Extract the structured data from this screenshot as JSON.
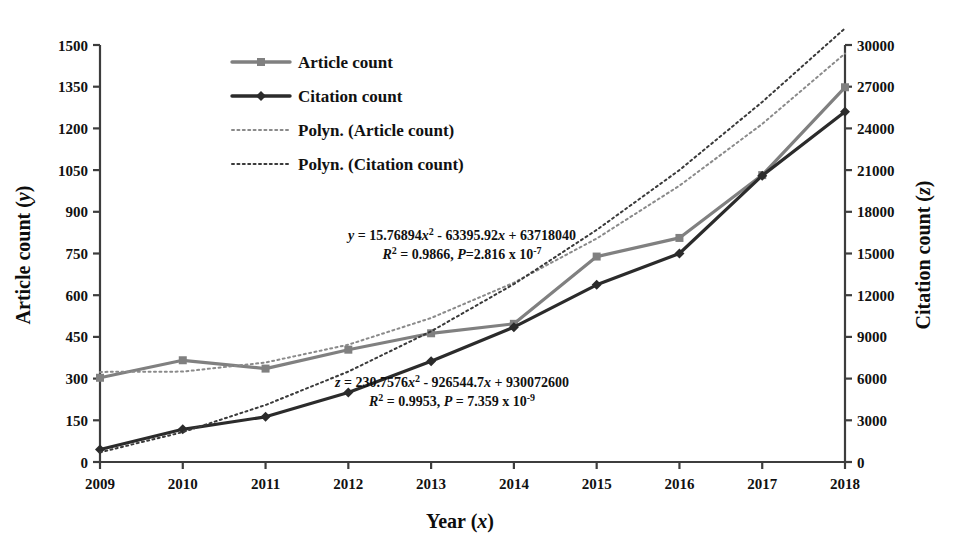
{
  "chart_data": {
    "type": "line",
    "title": "",
    "xlabel": "Year (x)",
    "ylabel": "Article count (y)",
    "y2label": "Citation count (z)",
    "categories": [
      2009,
      2010,
      2011,
      2012,
      2013,
      2014,
      2015,
      2016,
      2017,
      2018
    ],
    "x_tick_labels": [
      "2009",
      "2010",
      "2011",
      "2012",
      "2013",
      "2014",
      "2015",
      "2016",
      "2017",
      "2018"
    ],
    "xlim": [
      2009,
      2018
    ],
    "ylim": [
      0,
      1500
    ],
    "y_tick_labels": [
      "0",
      "150",
      "300",
      "450",
      "600",
      "750",
      "900",
      "1050",
      "1200",
      "1350",
      "1500"
    ],
    "y_ticks": [
      0,
      150,
      300,
      450,
      600,
      750,
      900,
      1050,
      1200,
      1350,
      1500
    ],
    "y2lim": [
      0,
      30000
    ],
    "y2_tick_labels": [
      "0",
      "3000",
      "6000",
      "9000",
      "12000",
      "15000",
      "18000",
      "21000",
      "24000",
      "27000",
      "30000"
    ],
    "y2_ticks": [
      0,
      3000,
      6000,
      9000,
      12000,
      15000,
      18000,
      21000,
      24000,
      27000,
      30000
    ],
    "grid": false,
    "legend_position": "top-left",
    "series": [
      {
        "name": "Article count",
        "axis": "left",
        "style": "solid",
        "color": "#808080",
        "marker": "square",
        "values": [
          303,
          366,
          336,
          404,
          463,
          497,
          739,
          806,
          1032,
          1348
        ]
      },
      {
        "name": "Citation count",
        "axis": "right",
        "style": "solid",
        "color": "#2b2b2b",
        "marker": "diamond",
        "values": [
          900,
          2350,
          3250,
          5000,
          7250,
          9700,
          12750,
          15000,
          20600,
          25200
        ]
      },
      {
        "name": "Polyn. (Article count)",
        "axis": "left",
        "style": "dotted",
        "color": "#8a8a8a",
        "marker": "none",
        "values": [
          324,
          325,
          358,
          422,
          518,
          645,
          804,
          994,
          1216,
          1469
        ]
      },
      {
        "name": "Polyn. (Citation count)",
        "axis": "right",
        "style": "dotted",
        "color": "#3a3a3a",
        "marker": "none",
        "values": [
          700,
          2150,
          4100,
          6500,
          9400,
          12800,
          16700,
          21000,
          25900,
          31200
        ]
      }
    ],
    "annotations": [
      {
        "id": "article-equation",
        "line1": "y = 15.76894x² - 63395.92x + 63718040",
        "line2": "R² = 0.9866, P=2.816 x 10⁻⁷"
      },
      {
        "id": "citation-equation",
        "line1": "z = 230.7576x² - 926544.7x + 930072600",
        "line2": "R² = 0.9953, P = 7.359 x 10⁻⁹"
      }
    ]
  },
  "legend": {
    "items": [
      {
        "label": "Article count"
      },
      {
        "label": "Citation count"
      },
      {
        "label": "Polyn. (Article count)"
      },
      {
        "label": "Polyn. (Citation count)"
      }
    ]
  },
  "equations": {
    "article": {
      "lead": "y",
      "body": " = 15.76894",
      "var1": "x",
      "sup1": "2",
      "body2": " - 63395.92",
      "var2": "x",
      "body3": " + 63718040",
      "r_lead": "R",
      "r_sup": "2",
      "r_body": " = 0.9866, ",
      "p_lead": "P",
      "p_body": "=2.816 x 10",
      "p_sup": "-7"
    },
    "citation": {
      "lead": "z",
      "body": " = 230.7576",
      "var1": "x",
      "sup1": "2",
      "body2": " - 926544.7",
      "var2": "x",
      "body3": " + 930072600",
      "r_lead": "R",
      "r_sup": "2",
      "r_body": " = 0.9953, ",
      "p_lead": "P",
      "p_body": " = 7.359 x 10",
      "p_sup": "-9"
    }
  },
  "axes": {
    "left_title_main": "Article count (",
    "left_title_var": "y",
    "left_title_end": ")",
    "right_title_main": "Citation count (",
    "right_title_var": "z",
    "right_title_end": ")",
    "x_title_main": "Year (",
    "x_title_var": "x",
    "x_title_end": ")"
  },
  "colors": {
    "article": "#808080",
    "citation": "#2b2b2b",
    "axis": "#3d3d3d",
    "background": "#ffffff"
  }
}
